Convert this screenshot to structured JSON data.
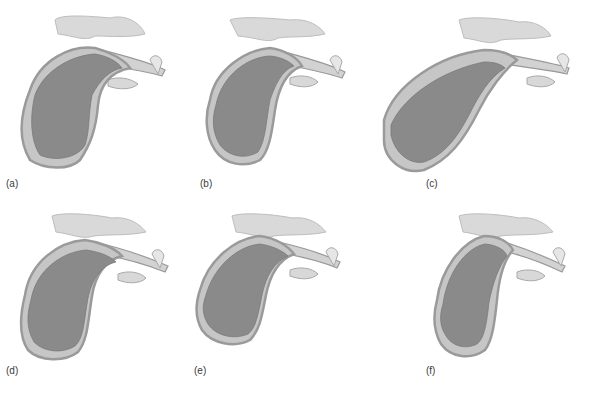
{
  "figure": {
    "colors": {
      "background": "#ffffff",
      "fetus": "#8a8a8a",
      "uterus_wall": "#9a9a9a",
      "fluid": "#cdcdcd",
      "spine_pelvis": "#d9d9d9",
      "label_text": "#3a3a3a"
    },
    "panels": [
      {
        "id": "a",
        "label": "(a)"
      },
      {
        "id": "b",
        "label": "(b)"
      },
      {
        "id": "c",
        "label": "(c)"
      },
      {
        "id": "d",
        "label": "(d)"
      },
      {
        "id": "e",
        "label": "(e)"
      },
      {
        "id": "f",
        "label": "(f)"
      }
    ]
  }
}
